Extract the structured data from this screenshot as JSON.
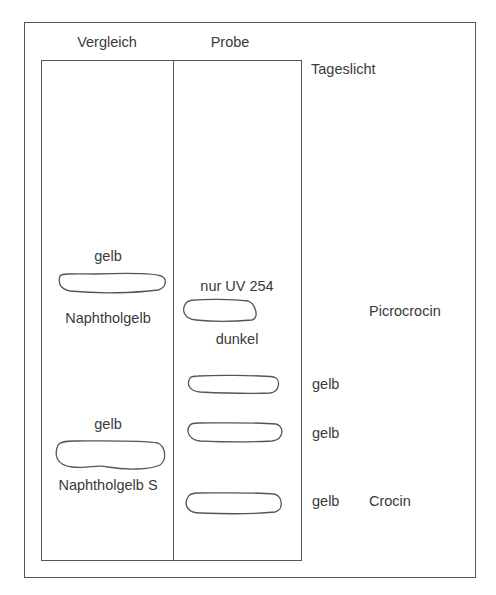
{
  "columns": {
    "reference": "Vergleich",
    "sample": "Probe"
  },
  "illumination": "Tageslicht",
  "reference_spots": [
    {
      "above": "gelb",
      "below": "Naphtholgelb"
    },
    {
      "above": "gelb",
      "below": "Naphtholgelb S"
    }
  ],
  "sample_spots": [
    {
      "above": "nur UV 254",
      "below": "dunkel",
      "color": "",
      "compound": "Picrocrocin"
    },
    {
      "color": "gelb",
      "compound": ""
    },
    {
      "color": "gelb",
      "compound": ""
    },
    {
      "color": "gelb",
      "compound": "Crocin"
    }
  ],
  "colors": {
    "line": "#555555",
    "text": "#3a3a3a",
    "background": "#ffffff"
  }
}
